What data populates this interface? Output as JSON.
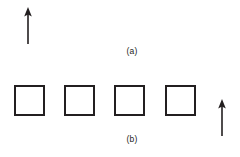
{
  "figure": {
    "background_color": "#ffffff",
    "stroke_color": "#231f20",
    "width": 240,
    "height": 157
  },
  "panel_a": {
    "caption": "(a)",
    "arrow": {
      "name": "upward-arrow",
      "direction": "up",
      "x": 28,
      "y_tip": 8,
      "y_tail": 45,
      "color": "#231f20"
    }
  },
  "panel_b": {
    "caption": "(b)",
    "squares": [
      {
        "label": "square-1",
        "x": 14,
        "y": 85,
        "size": 31
      },
      {
        "label": "square-2",
        "x": 64,
        "y": 85,
        "size": 31
      },
      {
        "label": "square-3",
        "x": 114,
        "y": 85,
        "size": 31
      },
      {
        "label": "square-4",
        "x": 165,
        "y": 85,
        "size": 31
      }
    ],
    "arrow": {
      "name": "upward-arrow",
      "direction": "up",
      "x": 222,
      "y_tip": 100,
      "y_tail": 137,
      "color": "#231f20"
    }
  }
}
